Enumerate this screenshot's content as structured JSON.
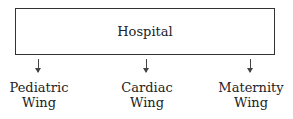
{
  "diagram": {
    "root": {
      "label": "Hospital"
    },
    "children": [
      {
        "line1": "Pediatric",
        "line2": "Wing"
      },
      {
        "line1": "Cardiac",
        "line2": "Wing"
      },
      {
        "line1": "Maternity",
        "line2": "Wing"
      }
    ]
  }
}
